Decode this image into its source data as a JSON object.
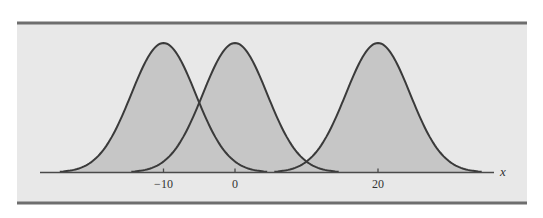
{
  "chart_data": {
    "type": "area",
    "title": "",
    "xlabel": "x",
    "ylabel": "",
    "x_ticks": [
      -10,
      0,
      20
    ],
    "x_tick_labels": [
      "−10",
      "0",
      "20"
    ],
    "xlim": [
      -28,
      37
    ],
    "grid": false,
    "legend": null,
    "series": [
      {
        "name": "curve-mean-neg10",
        "mean": -10,
        "sd": 4.5,
        "x_range": [
          -24.5,
          4.5
        ]
      },
      {
        "name": "curve-mean-0",
        "mean": 0,
        "sd": 4.5,
        "x_range": [
          -14.5,
          14.5
        ]
      },
      {
        "name": "curve-mean-20",
        "mean": 20,
        "sd": 4.5,
        "x_range": [
          5.5,
          34.5
        ]
      }
    ],
    "colors": {
      "panel_background": "#e8e8e8",
      "curve_fill": "#c6c6c6",
      "curve_line": "#3a3a3a",
      "axis_line": "#4a4a4a",
      "frame_bar": "#6e6e6e"
    }
  }
}
